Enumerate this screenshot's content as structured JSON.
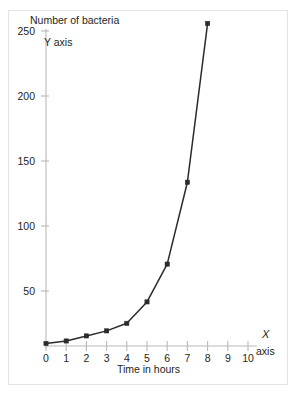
{
  "figure": {
    "top_sliver_text": "",
    "title": "Number of bacteria",
    "y_axis_note": "Y axis",
    "x_axis_note_symbol": "X",
    "x_axis_note_word": "axis",
    "x_axis_caption": "Time in hours"
  },
  "colors": {
    "series": "#2b2b2b",
    "axis": "#b9b9b9",
    "frame": "#e3e3e3",
    "background": "#ffffff",
    "text": "#231f20"
  },
  "chart_data": {
    "type": "line",
    "title": "Number of bacteria",
    "xlabel": "Time in hours",
    "ylabel": "Number of bacteria",
    "xlim": [
      0,
      10
    ],
    "ylim": [
      0,
      265
    ],
    "grid": false,
    "legend": false,
    "markers": "square",
    "x": [
      0,
      1,
      2,
      3,
      4,
      5,
      6,
      7,
      8
    ],
    "values": [
      2,
      4,
      8,
      12,
      18,
      35,
      65,
      130,
      256
    ],
    "series": [
      {
        "name": "Number of bacteria",
        "x": [
          0,
          1,
          2,
          3,
          4,
          5,
          6,
          7,
          8
        ],
        "values": [
          2,
          4,
          8,
          12,
          18,
          35,
          65,
          130,
          256
        ]
      }
    ],
    "xticks": [
      0,
      1,
      2,
      3,
      4,
      5,
      6,
      7,
      8,
      9,
      10
    ],
    "xtick_labels": [
      "0",
      "1",
      "2",
      "3",
      "4",
      "5",
      "6",
      "7",
      "8",
      "9",
      "10"
    ],
    "yticks": [
      50,
      100,
      150,
      200,
      250
    ],
    "ytick_labels": [
      "50",
      "100",
      "150",
      "200",
      "250"
    ],
    "annotations": [
      {
        "text": "Y axis",
        "near": "y-axis-top"
      },
      {
        "text": "X axis",
        "near": "x-axis-right"
      }
    ]
  }
}
